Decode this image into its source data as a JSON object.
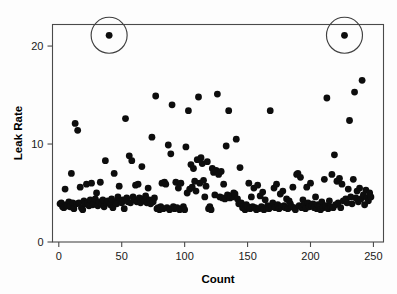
{
  "chart_data": {
    "type": "scatter",
    "title": "",
    "xlabel": "Count",
    "ylabel": "Leak Rate",
    "xlim": [
      -5,
      258
    ],
    "ylim": [
      0,
      22.2
    ],
    "xticks": [
      0,
      50,
      100,
      150,
      200,
      250
    ],
    "yticks": [
      0,
      10,
      20
    ],
    "xtick_labels": [
      "0",
      "50",
      "100",
      "150",
      "200",
      "250"
    ],
    "ytick_labels": [
      "0",
      "10",
      "20"
    ],
    "grid": false,
    "legend": null,
    "marker": "filled-circle",
    "marker_color": "#0d0d0d",
    "marker_size_px": 3.4,
    "frame": "box",
    "annotations": [
      {
        "type": "circle",
        "label": "outlier-highlight-left",
        "x": 40,
        "y": 21.1,
        "radius_px": 18
      },
      {
        "type": "circle",
        "label": "outlier-highlight-right",
        "x": 227,
        "y": 21.1,
        "radius_px": 18
      }
    ],
    "points": [
      [
        1,
        3.9
      ],
      [
        2,
        4.0
      ],
      [
        3,
        3.6
      ],
      [
        4,
        3.5
      ],
      [
        5,
        5.4
      ],
      [
        6,
        3.8
      ],
      [
        7,
        3.7
      ],
      [
        8,
        4.1
      ],
      [
        9,
        3.6
      ],
      [
        10,
        7.0
      ],
      [
        11,
        4.0
      ],
      [
        12,
        3.4
      ],
      [
        13,
        12.1
      ],
      [
        14,
        3.9
      ],
      [
        15,
        11.4
      ],
      [
        16,
        4.0
      ],
      [
        17,
        5.6
      ],
      [
        18,
        3.5
      ],
      [
        19,
        3.3
      ],
      [
        20,
        4.2
      ],
      [
        21,
        3.9
      ],
      [
        22,
        5.9
      ],
      [
        23,
        4.0
      ],
      [
        24,
        3.7
      ],
      [
        25,
        4.3
      ],
      [
        26,
        6.0
      ],
      [
        27,
        3.8
      ],
      [
        28,
        4.0
      ],
      [
        29,
        4.4
      ],
      [
        30,
        5.0
      ],
      [
        31,
        3.7
      ],
      [
        32,
        4.1
      ],
      [
        33,
        6.1
      ],
      [
        34,
        3.9
      ],
      [
        35,
        4.3
      ],
      [
        36,
        3.6
      ],
      [
        37,
        8.3
      ],
      [
        38,
        4.0
      ],
      [
        39,
        4.2
      ],
      [
        40,
        21.1
      ],
      [
        41,
        3.8
      ],
      [
        42,
        4.4
      ],
      [
        43,
        3.5
      ],
      [
        44,
        7.0
      ],
      [
        45,
        4.1
      ],
      [
        46,
        3.9
      ],
      [
        47,
        4.6
      ],
      [
        48,
        5.7
      ],
      [
        49,
        4.2
      ],
      [
        50,
        4.0
      ],
      [
        51,
        4.3
      ],
      [
        52,
        3.4
      ],
      [
        53,
        12.6
      ],
      [
        54,
        4.5
      ],
      [
        55,
        4.1
      ],
      [
        56,
        8.8
      ],
      [
        57,
        4.0
      ],
      [
        58,
        8.3
      ],
      [
        59,
        4.6
      ],
      [
        60,
        4.3
      ],
      [
        61,
        5.8
      ],
      [
        62,
        4.1
      ],
      [
        63,
        5.9
      ],
      [
        64,
        4.5
      ],
      [
        65,
        4.0
      ],
      [
        66,
        7.7
      ],
      [
        67,
        4.4
      ],
      [
        68,
        4.2
      ],
      [
        69,
        4.7
      ],
      [
        70,
        4.0
      ],
      [
        71,
        5.5
      ],
      [
        72,
        4.3
      ],
      [
        73,
        3.9
      ],
      [
        74,
        10.7
      ],
      [
        75,
        4.1
      ],
      [
        76,
        4.5
      ],
      [
        77,
        14.9
      ],
      [
        78,
        3.4
      ],
      [
        79,
        3.5
      ],
      [
        80,
        3.3
      ],
      [
        81,
        3.6
      ],
      [
        82,
        6.0
      ],
      [
        83,
        3.4
      ],
      [
        84,
        6.1
      ],
      [
        85,
        5.9
      ],
      [
        86,
        3.5
      ],
      [
        87,
        9.9
      ],
      [
        88,
        3.3
      ],
      [
        89,
        9.0
      ],
      [
        90,
        14.0
      ],
      [
        91,
        3.6
      ],
      [
        92,
        3.4
      ],
      [
        93,
        6.1
      ],
      [
        94,
        3.5
      ],
      [
        95,
        5.5
      ],
      [
        96,
        3.3
      ],
      [
        97,
        6.0
      ],
      [
        98,
        3.4
      ],
      [
        99,
        3.6
      ],
      [
        100,
        3.3
      ],
      [
        101,
        9.7
      ],
      [
        102,
        5.0
      ],
      [
        103,
        13.4
      ],
      [
        104,
        5.4
      ],
      [
        105,
        7.9
      ],
      [
        106,
        5.6
      ],
      [
        107,
        7.5
      ],
      [
        108,
        6.2
      ],
      [
        109,
        5.2
      ],
      [
        110,
        8.4
      ],
      [
        111,
        14.8
      ],
      [
        112,
        6.0
      ],
      [
        113,
        8.6
      ],
      [
        114,
        8.0
      ],
      [
        115,
        6.3
      ],
      [
        116,
        4.6
      ],
      [
        117,
        5.7
      ],
      [
        118,
        8.2
      ],
      [
        119,
        3.4
      ],
      [
        120,
        3.6
      ],
      [
        121,
        3.3
      ],
      [
        122,
        7.5
      ],
      [
        123,
        7.1
      ],
      [
        124,
        4.8
      ],
      [
        125,
        7.3
      ],
      [
        126,
        15.1
      ],
      [
        127,
        6.9
      ],
      [
        128,
        4.6
      ],
      [
        129,
        7.2
      ],
      [
        130,
        4.5
      ],
      [
        131,
        5.9
      ],
      [
        132,
        4.4
      ],
      [
        133,
        9.8
      ],
      [
        134,
        4.8
      ],
      [
        135,
        13.4
      ],
      [
        136,
        4.5
      ],
      [
        137,
        4.7
      ],
      [
        138,
        4.6
      ],
      [
        139,
        5.0
      ],
      [
        140,
        4.9
      ],
      [
        141,
        10.5
      ],
      [
        142,
        4.4
      ],
      [
        143,
        3.9
      ],
      [
        144,
        7.6
      ],
      [
        145,
        4.0
      ],
      [
        146,
        3.5
      ],
      [
        147,
        3.7
      ],
      [
        148,
        3.3
      ],
      [
        149,
        3.8
      ],
      [
        150,
        3.6
      ],
      [
        151,
        6.0
      ],
      [
        152,
        3.4
      ],
      [
        153,
        4.6
      ],
      [
        154,
        3.6
      ],
      [
        155,
        5.5
      ],
      [
        156,
        3.5
      ],
      [
        157,
        3.3
      ],
      [
        158,
        5.8
      ],
      [
        159,
        3.4
      ],
      [
        160,
        4.7
      ],
      [
        161,
        3.6
      ],
      [
        162,
        5.1
      ],
      [
        163,
        3.3
      ],
      [
        164,
        4.3
      ],
      [
        165,
        3.5
      ],
      [
        166,
        3.7
      ],
      [
        167,
        3.4
      ],
      [
        168,
        13.4
      ],
      [
        169,
        3.6
      ],
      [
        170,
        4.0
      ],
      [
        171,
        5.5
      ],
      [
        172,
        3.5
      ],
      [
        173,
        5.9
      ],
      [
        174,
        3.8
      ],
      [
        175,
        3.4
      ],
      [
        176,
        4.9
      ],
      [
        177,
        3.6
      ],
      [
        178,
        5.2
      ],
      [
        179,
        3.7
      ],
      [
        180,
        3.5
      ],
      [
        181,
        4.4
      ],
      [
        182,
        3.4
      ],
      [
        183,
        4.2
      ],
      [
        184,
        3.9
      ],
      [
        185,
        3.6
      ],
      [
        186,
        5.6
      ],
      [
        187,
        3.5
      ],
      [
        188,
        3.3
      ],
      [
        189,
        6.9
      ],
      [
        190,
        7.0
      ],
      [
        191,
        3.7
      ],
      [
        192,
        6.6
      ],
      [
        193,
        3.5
      ],
      [
        194,
        4.3
      ],
      [
        195,
        3.8
      ],
      [
        196,
        3.4
      ],
      [
        197,
        5.6
      ],
      [
        198,
        4.0
      ],
      [
        199,
        3.6
      ],
      [
        200,
        6.0
      ],
      [
        201,
        3.7
      ],
      [
        202,
        3.9
      ],
      [
        203,
        3.5
      ],
      [
        204,
        4.6
      ],
      [
        205,
        3.4
      ],
      [
        206,
        3.8
      ],
      [
        207,
        3.6
      ],
      [
        208,
        3.3
      ],
      [
        209,
        4.1
      ],
      [
        210,
        3.5
      ],
      [
        211,
        6.4
      ],
      [
        212,
        3.7
      ],
      [
        213,
        14.7
      ],
      [
        214,
        3.4
      ],
      [
        215,
        4.2
      ],
      [
        216,
        3.6
      ],
      [
        217,
        6.9
      ],
      [
        218,
        3.5
      ],
      [
        219,
        8.9
      ],
      [
        220,
        3.8
      ],
      [
        221,
        6.2
      ],
      [
        222,
        4.0
      ],
      [
        223,
        6.5
      ],
      [
        224,
        3.5
      ],
      [
        225,
        5.9
      ],
      [
        226,
        4.2
      ],
      [
        227,
        21.1
      ],
      [
        228,
        4.4
      ],
      [
        229,
        4.0
      ],
      [
        230,
        5.4
      ],
      [
        231,
        12.4
      ],
      [
        232,
        4.6
      ],
      [
        233,
        3.9
      ],
      [
        234,
        6.4
      ],
      [
        235,
        15.3
      ],
      [
        236,
        4.5
      ],
      [
        237,
        5.2
      ],
      [
        238,
        4.1
      ],
      [
        239,
        5.5
      ],
      [
        240,
        4.4
      ],
      [
        241,
        16.5
      ],
      [
        242,
        4.8
      ],
      [
        243,
        3.8
      ],
      [
        244,
        5.3
      ],
      [
        245,
        4.5
      ],
      [
        246,
        4.2
      ],
      [
        247,
        5.0
      ],
      [
        248,
        4.6
      ]
    ]
  },
  "axes": {
    "y_title": "Leak Rate",
    "x_title": "Count"
  }
}
